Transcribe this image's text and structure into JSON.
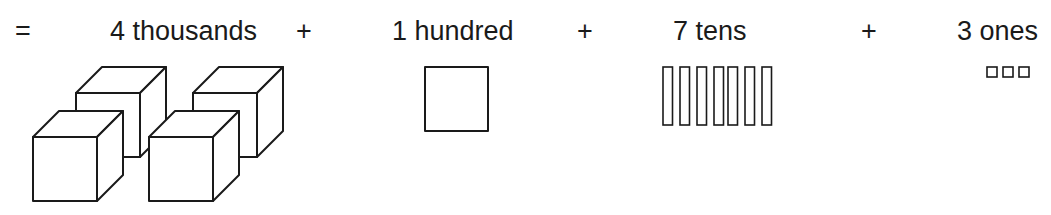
{
  "equation": {
    "equals": "=",
    "plus": "+",
    "terms": [
      {
        "label": "4 thousands",
        "count": 4,
        "block": "thousand-cube"
      },
      {
        "label": "1 hundred",
        "count": 1,
        "block": "hundred-flat"
      },
      {
        "label": "7 tens",
        "count": 7,
        "block": "ten-rod"
      },
      {
        "label": "3 ones",
        "count": 3,
        "block": "one-unit"
      }
    ]
  },
  "colors": {
    "ink": "#1a1a1a",
    "background": "#ffffff"
  }
}
